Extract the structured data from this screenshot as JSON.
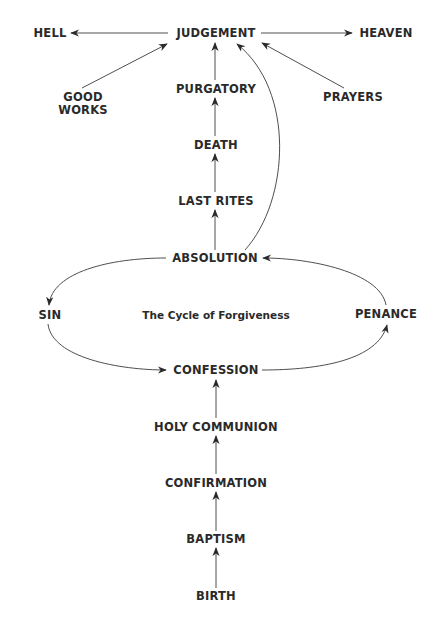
{
  "diagram": {
    "title": "The Cycle of Forgiveness",
    "colors": {
      "text": "#2a2a2a",
      "line": "#3a3a3a",
      "background": "#ffffff"
    },
    "nodes": {
      "judgement": "JUDGEMENT",
      "hell": "HELL",
      "heaven": "HEAVEN",
      "good_works_line1": "GOOD",
      "good_works_line2": "WORKS",
      "purgatory": "PURGATORY",
      "prayers": "PRAYERS",
      "death": "DEATH",
      "last_rites": "LAST RITES",
      "absolution": "ABSOLUTION",
      "sin": "SIN",
      "penance": "PENANCE",
      "confession": "CONFESSION",
      "holy_communion": "HOLY COMMUNION",
      "confirmation": "CONFIRMATION",
      "baptism": "BAPTISM",
      "birth": "BIRTH"
    },
    "edges": [
      {
        "from": "JUDGEMENT",
        "to": "HELL"
      },
      {
        "from": "JUDGEMENT",
        "to": "HEAVEN"
      },
      {
        "from": "GOOD WORKS",
        "to": "JUDGEMENT"
      },
      {
        "from": "PRAYERS",
        "to": "JUDGEMENT"
      },
      {
        "from": "PURGATORY",
        "to": "JUDGEMENT"
      },
      {
        "from": "ABSOLUTION",
        "to": "JUDGEMENT",
        "style": "curved"
      },
      {
        "from": "DEATH",
        "to": "PURGATORY"
      },
      {
        "from": "LAST RITES",
        "to": "DEATH"
      },
      {
        "from": "ABSOLUTION",
        "to": "LAST RITES"
      },
      {
        "from": "ABSOLUTION",
        "to": "SIN",
        "style": "curved"
      },
      {
        "from": "SIN",
        "to": "CONFESSION",
        "style": "curved"
      },
      {
        "from": "CONFESSION",
        "to": "PENANCE",
        "style": "curved"
      },
      {
        "from": "PENANCE",
        "to": "ABSOLUTION",
        "style": "curved"
      },
      {
        "from": "HOLY COMMUNION",
        "to": "CONFESSION"
      },
      {
        "from": "CONFIRMATION",
        "to": "HOLY COMMUNION"
      },
      {
        "from": "BAPTISM",
        "to": "CONFIRMATION"
      },
      {
        "from": "BIRTH",
        "to": "BAPTISM"
      }
    ]
  }
}
